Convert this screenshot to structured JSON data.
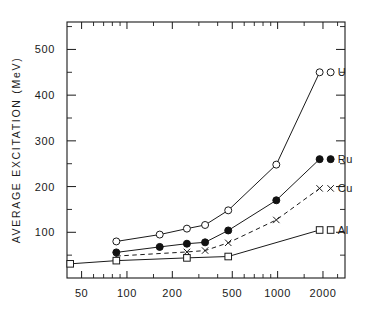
{
  "chart_data": {
    "type": "line",
    "title": "",
    "xlabel": "",
    "ylabel": "AVERAGE  EXCITATION  (MeV)",
    "xscale": "log",
    "yscale": "linear",
    "xlim": [
      40,
      2800
    ],
    "ylim": [
      0,
      560
    ],
    "grid": false,
    "legend_position": "right-inline-labels",
    "x_tick_labels": [
      "50",
      "100",
      "200",
      "500",
      "1000",
      "2000"
    ],
    "x_tick_values": [
      50,
      100,
      200,
      500,
      1000,
      2000
    ],
    "x_minor_ticks": [
      60,
      70,
      80,
      90,
      150,
      300,
      400,
      600,
      700,
      800,
      900,
      1500,
      2500
    ],
    "y_tick_labels": [
      "100",
      "200",
      "300",
      "400",
      "500"
    ],
    "y_tick_values": [
      100,
      200,
      300,
      400,
      500
    ],
    "y_minor_ticks": [
      50,
      150,
      250,
      350,
      450,
      550
    ],
    "series": [
      {
        "name": "U",
        "label": "U",
        "marker": "open-circle",
        "line": "solid",
        "x": [
          85,
          165,
          250,
          330,
          470,
          980,
          1900
        ],
        "values": [
          80,
          95,
          108,
          116,
          148,
          248,
          450
        ]
      },
      {
        "name": "Ru",
        "label": "Ru",
        "marker": "filled-circle",
        "line": "solid",
        "x": [
          85,
          165,
          250,
          330,
          470,
          980,
          1900
        ],
        "values": [
          56,
          68,
          75,
          78,
          104,
          170,
          260
        ]
      },
      {
        "name": "Cu",
        "label": "Cu",
        "marker": "cross",
        "line": "dashed",
        "x": [
          85,
          250,
          330,
          470,
          980,
          1900
        ],
        "values": [
          48,
          57,
          60,
          77,
          127,
          196
        ]
      },
      {
        "name": "Al",
        "label": "Al",
        "marker": "open-square",
        "line": "solid",
        "x": [
          42,
          85,
          250,
          470,
          1900
        ],
        "values": [
          31,
          38,
          44,
          47,
          105
        ]
      }
    ]
  }
}
